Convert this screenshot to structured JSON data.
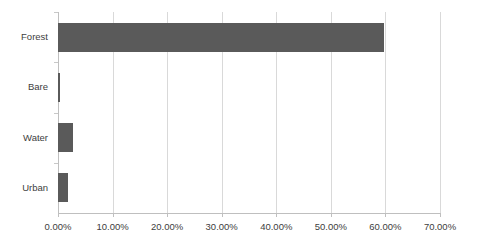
{
  "chart_data": {
    "type": "bar",
    "orientation": "horizontal",
    "title": "",
    "xlabel": "",
    "ylabel": "",
    "categories": [
      "Forest",
      "Bare",
      "Water",
      "Urban"
    ],
    "values": [
      59.8,
      0.4,
      2.7,
      1.8
    ],
    "value_format": "percent",
    "xlim": [
      0,
      70
    ],
    "xticks": [
      0,
      10,
      20,
      30,
      40,
      50,
      60,
      70
    ],
    "xticklabels": [
      "0.00%",
      "10.00%",
      "20.00%",
      "30.00%",
      "40.00%",
      "50.00%",
      "60.00%",
      "70.00%"
    ],
    "grid": {
      "vertical": true,
      "horizontal": false,
      "color": "#d9d9d9"
    },
    "legend": {
      "visible": false,
      "position": "none",
      "entries": []
    },
    "series": [
      {
        "name": "Land cover share",
        "color": "#5a5a5a",
        "values": [
          59.8,
          0.4,
          2.7,
          1.8
        ]
      }
    ],
    "annotations": [],
    "background_color": "#ffffff",
    "axis_color": "#bfbfbf",
    "tick_label_color": "#404040"
  }
}
